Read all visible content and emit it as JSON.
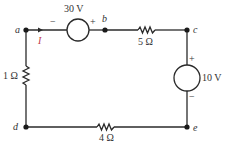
{
  "diagram": {
    "type": "circuit",
    "colors": {
      "wire": "#2a2a2a",
      "text": "#333333",
      "current": "#c0394a",
      "background": "#ffffff"
    },
    "nodes": [
      {
        "id": "a",
        "label": "a"
      },
      {
        "id": "b",
        "label": "b"
      },
      {
        "id": "c",
        "label": "c"
      },
      {
        "id": "d",
        "label": "d"
      },
      {
        "id": "e",
        "label": "e"
      }
    ],
    "components": {
      "source_30v": {
        "label": "30 V",
        "type": "voltage-source",
        "between": "a-b",
        "plus": "+",
        "minus": "−"
      },
      "source_10v": {
        "label": "10 V",
        "type": "voltage-source",
        "between": "c-e",
        "plus": "+",
        "minus": "−"
      },
      "resistor_5": {
        "label": "5 Ω",
        "type": "resistor",
        "between": "b-c"
      },
      "resistor_1": {
        "label": "1 Ω",
        "type": "resistor",
        "between": "a-d"
      },
      "resistor_4": {
        "label": "4 Ω",
        "type": "resistor",
        "between": "d-e"
      }
    },
    "current": {
      "label": "I",
      "direction": "right",
      "location": "a toward 30 V source"
    }
  }
}
